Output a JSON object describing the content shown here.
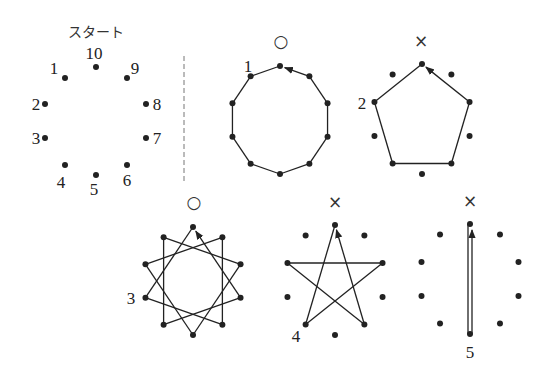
{
  "start_panel": {
    "title": "スタート",
    "points": [
      {
        "n": "1",
        "x": 65,
        "y": 78,
        "lx": 54,
        "ly": 74
      },
      {
        "n": "2",
        "x": 45,
        "y": 104,
        "lx": 36,
        "ly": 110
      },
      {
        "n": "3",
        "x": 45,
        "y": 138,
        "lx": 36,
        "ly": 144
      },
      {
        "n": "4",
        "x": 65,
        "y": 165,
        "lx": 61,
        "ly": 188
      },
      {
        "n": "5",
        "x": 96,
        "y": 175,
        "lx": 94,
        "ly": 195
      },
      {
        "n": "6",
        "x": 127,
        "y": 165,
        "lx": 127,
        "ly": 186
      },
      {
        "n": "7",
        "x": 146,
        "y": 138,
        "lx": 157,
        "ly": 144
      },
      {
        "n": "8",
        "x": 146,
        "y": 104,
        "lx": 157,
        "ly": 110
      },
      {
        "n": "9",
        "x": 127,
        "y": 78,
        "lx": 135,
        "ly": 74
      },
      {
        "n": "10",
        "x": 96,
        "y": 67,
        "lx": 94,
        "ly": 59
      }
    ]
  },
  "divider": {
    "x": 184,
    "y1": 56,
    "y2": 183
  },
  "figures": [
    {
      "id": "step1",
      "label": "1",
      "mark": "○",
      "verdict": "correct",
      "step": 1,
      "cx": 280,
      "cy": 120,
      "rx": 50,
      "ry": 54,
      "mark_x": 281,
      "mark_y": 47,
      "label_x": 248,
      "label_y": 72
    },
    {
      "id": "step2",
      "label": "2",
      "mark": "×",
      "verdict": "incorrect",
      "step": 2,
      "cx": 422,
      "cy": 119,
      "rx": 50,
      "ry": 55,
      "mark_x": 421,
      "mark_y": 47,
      "label_x": 362,
      "label_y": 109
    },
    {
      "id": "step3",
      "label": "3",
      "mark": "○",
      "verdict": "correct",
      "step": 3,
      "cx": 193,
      "cy": 281,
      "rx": 50,
      "ry": 54,
      "mark_x": 194,
      "mark_y": 208,
      "label_x": 131,
      "label_y": 304
    },
    {
      "id": "step4",
      "label": "4",
      "mark": "×",
      "verdict": "incorrect",
      "step": 4,
      "cx": 335,
      "cy": 280,
      "rx": 50,
      "ry": 55,
      "mark_x": 335,
      "mark_y": 208,
      "label_x": 296,
      "label_y": 342
    },
    {
      "id": "step5",
      "label": "5",
      "mark": "×",
      "verdict": "incorrect",
      "step": 5,
      "cx": 470,
      "cy": 279,
      "rx": 51,
      "ry": 55,
      "mark_x": 470,
      "mark_y": 207,
      "label_x": 470,
      "label_y": 358
    }
  ],
  "colors": {
    "ink": "#222222",
    "background": "#ffffff"
  }
}
